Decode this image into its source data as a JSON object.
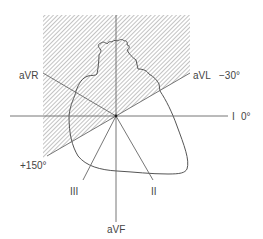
{
  "diagram": {
    "type": "hexaxial-reference-system",
    "colors": {
      "line": "#666666",
      "heart_outline": "#555555",
      "hatch": "#9a9a9a",
      "text": "#444444",
      "background": "#ffffff"
    },
    "labels": {
      "avr": "aVR",
      "avl": "aVL",
      "avl_angle": "−30°",
      "lead_i": "I",
      "lead_i_angle": "0°",
      "plus150": "+150°",
      "lead_iii": "III",
      "lead_ii": "II",
      "avf": "aVF"
    },
    "axes": [
      {
        "name": "I",
        "angle_deg": 0
      },
      {
        "name": "aVL",
        "angle_deg": -30
      },
      {
        "name": "aVR",
        "angle_deg": -150
      },
      {
        "name": "II",
        "angle_deg": 60
      },
      {
        "name": "III",
        "angle_deg": 120
      },
      {
        "name": "aVF",
        "angle_deg": 90
      }
    ],
    "shaded_region": {
      "from_deg": -30,
      "to_deg": 150,
      "direction": "counterclockwise-through-top",
      "description": "hatched region"
    }
  }
}
